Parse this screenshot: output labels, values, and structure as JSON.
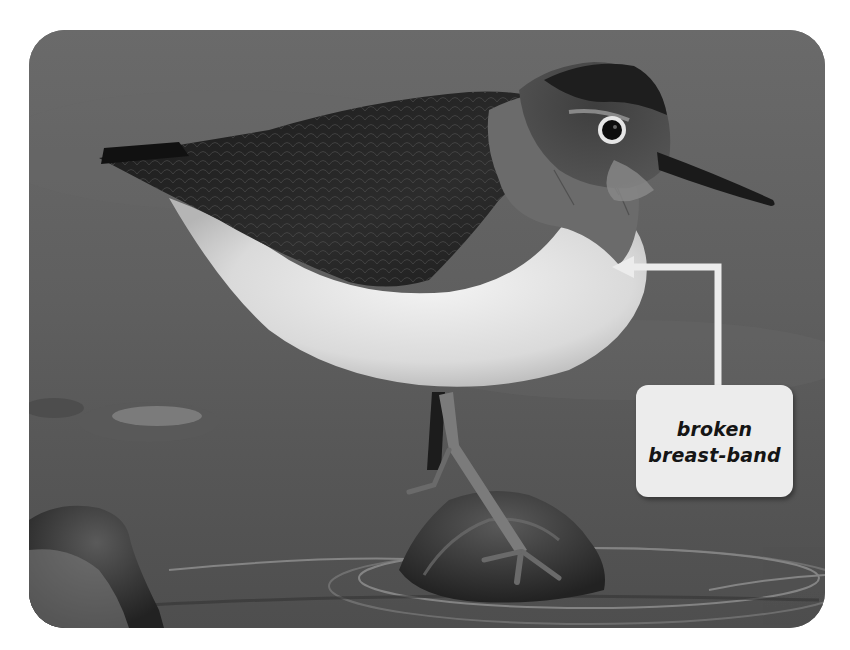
{
  "image": {
    "subject": "Common sandpiper standing on a rock in water (grayscale photograph)",
    "colors": {
      "page_background": "#ffffff",
      "water": "#5e5e5e",
      "callout_fill": "#ececec",
      "callout_text": "#151515",
      "arrow": "#ececec"
    }
  },
  "annotation": {
    "label_lines": [
      "broken",
      "breast-band"
    ],
    "pointer": "arrow pointing left to breast of bird"
  }
}
